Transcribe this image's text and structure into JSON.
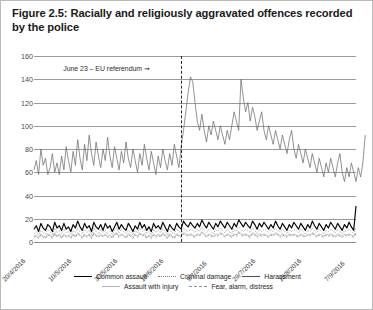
{
  "figure": {
    "title": "Figure 2.5: Racially and religiously aggravated offences recorded by the police"
  },
  "annotation": {
    "text": "June 23 – EU referendum ➞"
  },
  "legend": {
    "row1": [
      {
        "label": "Common assault",
        "style": "solid-black"
      },
      {
        "label": "Criminal damage",
        "style": "dotted-gray"
      },
      {
        "label": "Harassment",
        "style": "solid-dark"
      }
    ],
    "row2": [
      {
        "label": "Assault with injury",
        "style": "solid-light"
      },
      {
        "label": "Fear, alarm, distress",
        "style": "dashed-gray"
      }
    ]
  },
  "chart_data": {
    "type": "line",
    "title": "Figure 2.5: Racially and religiously aggravated offences recorded by the police",
    "xlabel": "",
    "ylabel": "",
    "ylim": [
      0,
      160
    ],
    "yticks": [
      0,
      20,
      40,
      60,
      80,
      100,
      120,
      140,
      160
    ],
    "grid": true,
    "legend_position": "bottom",
    "xtick_labels": [
      "20/4/2016",
      "10/5/2016",
      "30/5/2016",
      "19/6/2016",
      "9/7/2016",
      "29/7/2016",
      "18/8/2016",
      "7/9/2016"
    ],
    "xtick_indices": [
      0,
      20,
      40,
      60,
      80,
      100,
      120,
      140
    ],
    "n_points": 141,
    "annotations": [
      {
        "text": "June 23 – EU referendum ➞",
        "x_index": 64,
        "type": "vertical-dashed-line"
      }
    ],
    "series": [
      {
        "name": "Harassment",
        "color": "#6e6e6e",
        "style": "solid",
        "values": [
          62,
          70,
          58,
          80,
          66,
          72,
          58,
          64,
          76,
          60,
          68,
          58,
          74,
          62,
          82,
          70,
          60,
          78,
          66,
          88,
          72,
          62,
          84,
          70,
          92,
          76,
          66,
          86,
          74,
          64,
          80,
          70,
          90,
          74,
          64,
          82,
          72,
          62,
          78,
          68,
          86,
          72,
          64,
          80,
          70,
          60,
          76,
          66,
          84,
          72,
          62,
          78,
          68,
          58,
          74,
          64,
          80,
          70,
          62,
          76,
          66,
          84,
          74,
          64,
          82,
          96,
          112,
          128,
          142,
          138,
          120,
          104,
          96,
          110,
          96,
          86,
          100,
          92,
          104,
          96,
          88,
          100,
          92,
          84,
          96,
          88,
          100,
          112,
          104,
          96,
          140,
          124,
          112,
          120,
          104,
          116,
          108,
          96,
          104,
          112,
          96,
          88,
          100,
          92,
          84,
          96,
          88,
          80,
          92,
          84,
          76,
          88,
          96,
          80,
          72,
          84,
          76,
          68,
          80,
          72,
          64,
          76,
          68,
          60,
          72,
          64,
          56,
          68,
          60,
          72,
          64,
          56,
          68,
          76,
          60,
          52,
          64,
          56,
          68,
          60,
          52,
          64,
          56,
          68,
          92
        ]
      },
      {
        "name": "Common assault",
        "color": "#000000",
        "style": "solid",
        "values": [
          11,
          14,
          9,
          16,
          12,
          10,
          15,
          13,
          9,
          17,
          12,
          14,
          10,
          16,
          11,
          13,
          9,
          15,
          12,
          18,
          13,
          10,
          16,
          12,
          14,
          9,
          17,
          13,
          11,
          15,
          10,
          16,
          12,
          14,
          9,
          13,
          17,
          11,
          15,
          12,
          10,
          16,
          13,
          9,
          14,
          11,
          17,
          12,
          15,
          10,
          13,
          9,
          16,
          12,
          14,
          11,
          17,
          13,
          9,
          15,
          12,
          10,
          16,
          13,
          11,
          18,
          15,
          13,
          17,
          14,
          12,
          16,
          13,
          19,
          15,
          12,
          17,
          14,
          11,
          16,
          13,
          18,
          15,
          12,
          17,
          14,
          11,
          16,
          13,
          19,
          16,
          13,
          17,
          14,
          12,
          18,
          15,
          11,
          16,
          13,
          17,
          14,
          11,
          15,
          12,
          18,
          14,
          11,
          16,
          13,
          10,
          15,
          12,
          17,
          14,
          11,
          16,
          13,
          10,
          15,
          12,
          18,
          14,
          11,
          16,
          13,
          10,
          15,
          12,
          17,
          14,
          11,
          16,
          13,
          10,
          15,
          12,
          17,
          13,
          10,
          31
        ]
      },
      {
        "name": "Criminal damage",
        "color": "#7d7d7d",
        "style": "dotted",
        "values": [
          7,
          9,
          6,
          10,
          8,
          7,
          11,
          9,
          6,
          12,
          8,
          10,
          7,
          11,
          8,
          9,
          6,
          10,
          8,
          12,
          9,
          7,
          11,
          8,
          10,
          6,
          12,
          9,
          7,
          11,
          8,
          10,
          7,
          9,
          6,
          10,
          12,
          8,
          11,
          9,
          7,
          10,
          9,
          6,
          10,
          8,
          12,
          9,
          11,
          7,
          9,
          6,
          11,
          8,
          10,
          8,
          12,
          9,
          6,
          11,
          8,
          7,
          11,
          9,
          8,
          12,
          10,
          9,
          11,
          10,
          8,
          11,
          9,
          13,
          10,
          8,
          11,
          9,
          7,
          11,
          9,
          12,
          10,
          8,
          11,
          9,
          7,
          11,
          9,
          13,
          11,
          9,
          11,
          10,
          8,
          12,
          10,
          7,
          11,
          9,
          11,
          10,
          8,
          11,
          9,
          12,
          10,
          8,
          11,
          9,
          7,
          10,
          9,
          11,
          10,
          8,
          11,
          9,
          7,
          10,
          9,
          12,
          10,
          8,
          11,
          9,
          7,
          10,
          9,
          11,
          10,
          8,
          11,
          9,
          7,
          10,
          9,
          11,
          9,
          7,
          12
        ]
      },
      {
        "name": "Assault with injury",
        "color": "#b0b0b0",
        "style": "solid",
        "values": [
          5,
          6,
          4,
          7,
          5,
          4,
          7,
          6,
          4,
          8,
          5,
          7,
          4,
          7,
          5,
          6,
          4,
          7,
          5,
          8,
          6,
          4,
          7,
          5,
          7,
          4,
          8,
          6,
          5,
          7,
          5,
          7,
          5,
          6,
          4,
          7,
          8,
          5,
          7,
          6,
          4,
          7,
          6,
          4,
          7,
          5,
          8,
          6,
          7,
          4,
          6,
          4,
          7,
          5,
          7,
          5,
          8,
          6,
          4,
          7,
          5,
          4,
          7,
          6,
          5,
          8,
          7,
          6,
          7,
          6,
          5,
          7,
          6,
          9,
          7,
          5,
          7,
          6,
          5,
          7,
          6,
          8,
          7,
          5,
          7,
          6,
          5,
          7,
          6,
          9,
          7,
          6,
          7,
          6,
          5,
          8,
          7,
          5,
          7,
          6,
          7,
          6,
          5,
          7,
          6,
          8,
          7,
          5,
          7,
          6,
          5,
          7,
          6,
          7,
          6,
          5,
          7,
          6,
          5,
          7,
          6,
          8,
          7,
          5,
          7,
          6,
          5,
          7,
          6,
          7,
          6,
          5,
          7,
          6,
          5,
          7,
          6,
          7,
          6,
          5,
          8
        ]
      },
      {
        "name": "Fear, alarm, distress",
        "color": "#8e8e8e",
        "style": "dashed",
        "values": [
          4,
          5,
          3,
          6,
          4,
          3,
          6,
          5,
          3,
          7,
          4,
          6,
          3,
          6,
          4,
          5,
          3,
          6,
          4,
          7,
          5,
          3,
          6,
          4,
          6,
          3,
          7,
          5,
          4,
          6,
          4,
          6,
          4,
          5,
          3,
          6,
          7,
          4,
          6,
          5,
          3,
          6,
          5,
          3,
          6,
          4,
          7,
          5,
          6,
          3,
          5,
          3,
          6,
          4,
          6,
          4,
          7,
          5,
          3,
          6,
          4,
          3,
          6,
          5,
          4,
          7,
          6,
          5,
          6,
          5,
          4,
          6,
          5,
          8,
          6,
          4,
          6,
          5,
          4,
          6,
          5,
          7,
          6,
          4,
          6,
          5,
          4,
          6,
          5,
          8,
          6,
          5,
          6,
          5,
          4,
          7,
          6,
          4,
          6,
          5,
          6,
          5,
          4,
          6,
          5,
          7,
          6,
          4,
          6,
          5,
          4,
          6,
          5,
          6,
          5,
          4,
          6,
          5,
          4,
          6,
          5,
          7,
          6,
          4,
          6,
          5,
          4,
          6,
          5,
          6,
          5,
          4,
          6,
          5,
          4,
          6,
          5,
          6,
          5,
          4,
          7
        ]
      }
    ]
  }
}
